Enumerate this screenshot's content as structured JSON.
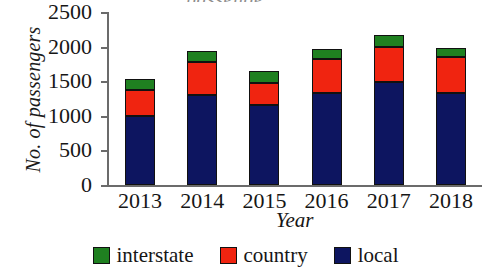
{
  "chart_data": {
    "type": "bar",
    "subtype": "stacked-bar",
    "title": "",
    "xlabel": "Year",
    "ylabel": "No. of passengers",
    "categories": [
      "2013",
      "2014",
      "2015",
      "2016",
      "2017",
      "2018"
    ],
    "series": [
      {
        "name": "local",
        "color": "#0d1560",
        "values": [
          1000,
          1300,
          1150,
          1330,
          1490,
          1330
        ]
      },
      {
        "name": "country",
        "color": "#f02410",
        "values": [
          370,
          480,
          320,
          490,
          500,
          520
        ]
      },
      {
        "name": "interstate",
        "color": "#1f8020",
        "values": [
          160,
          160,
          180,
          150,
          180,
          130
        ]
      }
    ],
    "totals": [
      1530,
      1940,
      1650,
      1970,
      2170,
      1980
    ],
    "ylim": [
      0,
      2500
    ],
    "yticks": [
      0,
      500,
      1000,
      1500,
      2000,
      2500
    ],
    "ytick_labels": [
      "0",
      "500",
      "1000",
      "1500",
      "2000",
      "2500"
    ],
    "grid": false,
    "legend_position": "bottom",
    "legend": [
      {
        "label": "interstate",
        "color": "#1f8020"
      },
      {
        "label": "country",
        "color": "#f02410"
      },
      {
        "label": "local",
        "color": "#0d1560"
      }
    ]
  },
  "title_remnant": "passenge"
}
